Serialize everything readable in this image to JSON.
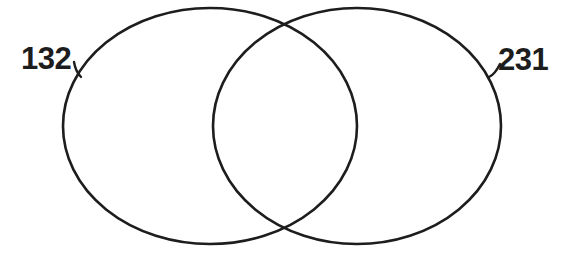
{
  "diagram": {
    "type": "venn",
    "background_color": "#ffffff",
    "stroke_color": "#1d1d1d",
    "left_set": {
      "label": "132"
    },
    "right_set": {
      "label": "231"
    }
  }
}
